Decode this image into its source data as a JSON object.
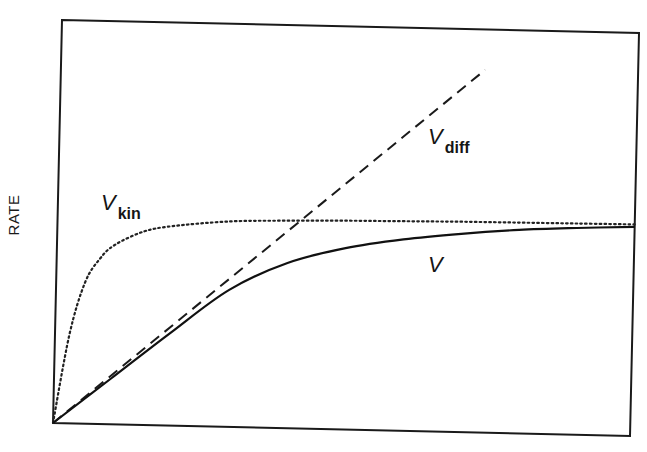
{
  "chart_data": {
    "type": "line",
    "title": "",
    "xlabel": "",
    "ylabel": "RATE",
    "xlim": [
      0,
      10
    ],
    "ylim": [
      0,
      10
    ],
    "grid": false,
    "legend": "none (curves labeled inline)",
    "series": [
      {
        "name": "V_kin",
        "label_main": "V",
        "label_sub": "kin",
        "style": "dotted",
        "x": [
          0,
          0.25,
          0.5,
          0.75,
          1.0,
          1.5,
          2.0,
          3.0,
          4.0,
          5.0,
          6.0,
          7.0,
          8.0,
          9.0,
          10.0
        ],
        "y": [
          0,
          2.2,
          3.5,
          4.1,
          4.45,
          4.8,
          4.95,
          5.1,
          5.15,
          5.18,
          5.2,
          5.22,
          5.23,
          5.24,
          5.25
        ]
      },
      {
        "name": "V_diff",
        "label_main": "V",
        "label_sub": "diff",
        "style": "dashed",
        "x": [
          0,
          7.35
        ],
        "y": [
          0,
          9.0
        ]
      },
      {
        "name": "V",
        "label_main": "V",
        "label_sub": "",
        "style": "solid",
        "x": [
          0,
          1.0,
          2.0,
          3.0,
          4.0,
          5.0,
          6.0,
          7.0,
          8.0,
          9.0,
          10.0
        ],
        "y": [
          0,
          1.15,
          2.3,
          3.4,
          4.1,
          4.5,
          4.75,
          4.92,
          5.05,
          5.13,
          5.19
        ]
      }
    ],
    "annotations": [
      {
        "text": "V_kin",
        "x": 1.0,
        "y": 5.6
      },
      {
        "text": "V_diff",
        "x": 6.2,
        "y": 6.6
      },
      {
        "text": "V",
        "x": 6.0,
        "y": 4.2
      }
    ]
  },
  "labels": {
    "ylabel": "RATE",
    "vkin_main": "V",
    "vkin_sub": "kin",
    "vdiff_main": "V",
    "vdiff_sub": "diff",
    "v_main": "V"
  }
}
